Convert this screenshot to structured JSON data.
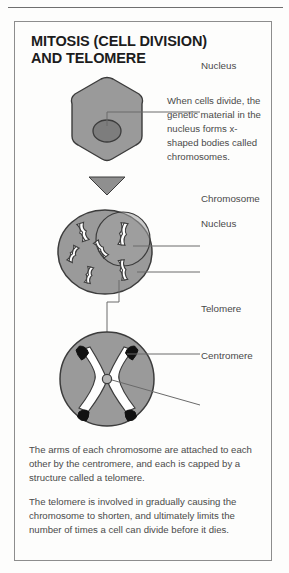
{
  "page": {
    "title_lines": [
      "MITOSIS (CELL DIVISION)",
      "AND TELOMERE"
    ]
  },
  "colors": {
    "cell_fill": "#9a9a9a",
    "cell_stroke": "#3c3c3c",
    "nucleus_fill": "#7d7d7d",
    "chromosome_fill": "#ffffff",
    "telomere_fill": "#111111",
    "text": "#4a4a4a",
    "border": "#8d8d8d"
  },
  "labels": {
    "nucleus_top": "Nucleus",
    "chromosome": "Chromosome",
    "nucleus_mid": "Nucleus",
    "telomere": "Telomere",
    "centromere": "Centromere"
  },
  "notes": {
    "inline": "When cells divide, the genetic material in the nucleus forms x-shaped bodies called chromosomes."
  },
  "paragraphs": {
    "p1": "The arms of each chromosome are attached to each other by the centromere, and each is capped by a structure called a telomere.",
    "p2": "The telomere is involved in gradually causing the chromosome to shorten, and ultimately limits the number of times a cell can divide before it dies."
  },
  "icons": {
    "arrow": "down-arrow-icon",
    "cell_top": "hexagon-cell-icon",
    "cell_mid": "dividing-cell-icon",
    "cell_bottom": "chromosome-closeup-icon"
  }
}
